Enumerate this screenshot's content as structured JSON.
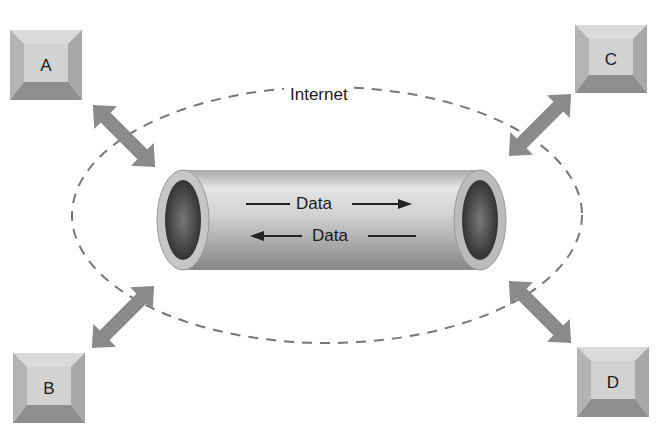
{
  "diagram": {
    "cloud_label": "Internet",
    "tunnel": {
      "labels": [
        "Data",
        "Data"
      ],
      "directions": [
        "right",
        "left"
      ]
    },
    "nodes": [
      {
        "id": "A",
        "label": "A",
        "position": "top-left"
      },
      {
        "id": "B",
        "label": "B",
        "position": "bottom-left"
      },
      {
        "id": "C",
        "label": "C",
        "position": "top-right"
      },
      {
        "id": "D",
        "label": "D",
        "position": "bottom-right"
      }
    ],
    "colors": {
      "node_face": "#c8c8c8",
      "node_bevel_dark": "#8e8e8e",
      "arrow": "#8a8a8a",
      "tunnel_body": "#c4c4c4",
      "dash": "#777777"
    }
  }
}
